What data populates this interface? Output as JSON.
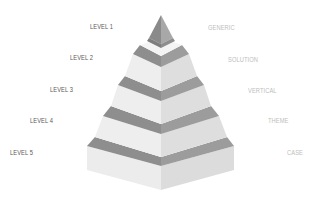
{
  "diagram": {
    "type": "pyramid",
    "tiers": [
      {
        "level": "LEVEL 1",
        "category": "GENERIC"
      },
      {
        "level": "LEVEL 2",
        "category": "SOLUTION"
      },
      {
        "level": "LEVEL 3",
        "category": "VERTICAL"
      },
      {
        "level": "LEVEL 4",
        "category": "THEME"
      },
      {
        "level": "LEVEL 5",
        "category": "CASE"
      }
    ],
    "colors": {
      "left_face": "#eeeeee",
      "right_face": "#dedede",
      "band_left": "#8c8c8c",
      "band_right": "#9a9a9a",
      "apex_left": "#8a8a8a",
      "apex_right": "#a6a6a6",
      "level_text": "#5a5a5a",
      "category_text": "#bdbdbd"
    }
  }
}
